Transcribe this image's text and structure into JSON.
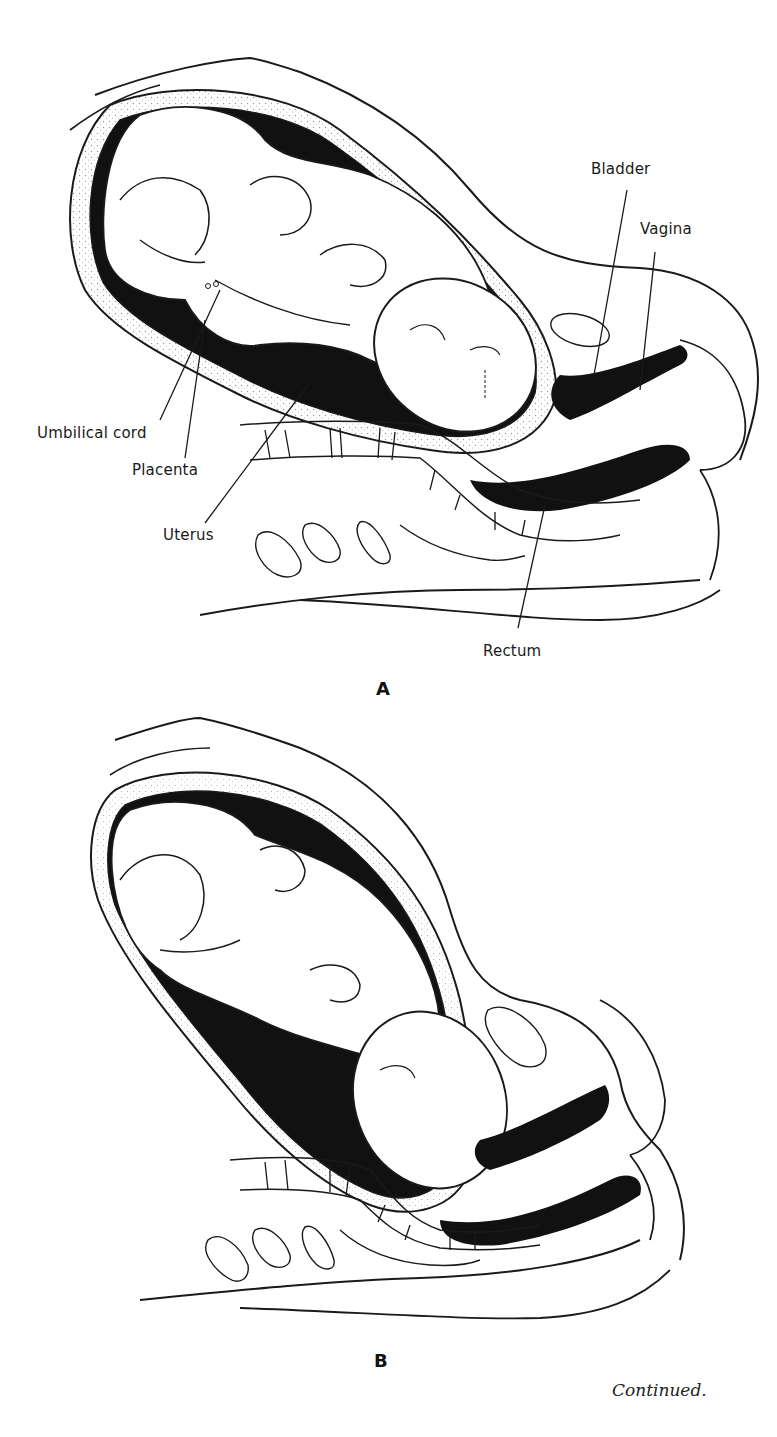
{
  "figure_a": {
    "panel_letter": "A",
    "labels": {
      "bladder": "Bladder",
      "vagina": "Vagina",
      "umbilical_cord": "Umbilical cord",
      "placenta": "Placenta",
      "uterus": "Uterus",
      "rectum": "Rectum"
    }
  },
  "figure_b": {
    "panel_letter": "B"
  },
  "caption": "Continued.",
  "colors": {
    "line": "#1a1a1a",
    "fill_dark": "#111111",
    "stipple": "#bdbdbd",
    "background": "#ffffff"
  }
}
